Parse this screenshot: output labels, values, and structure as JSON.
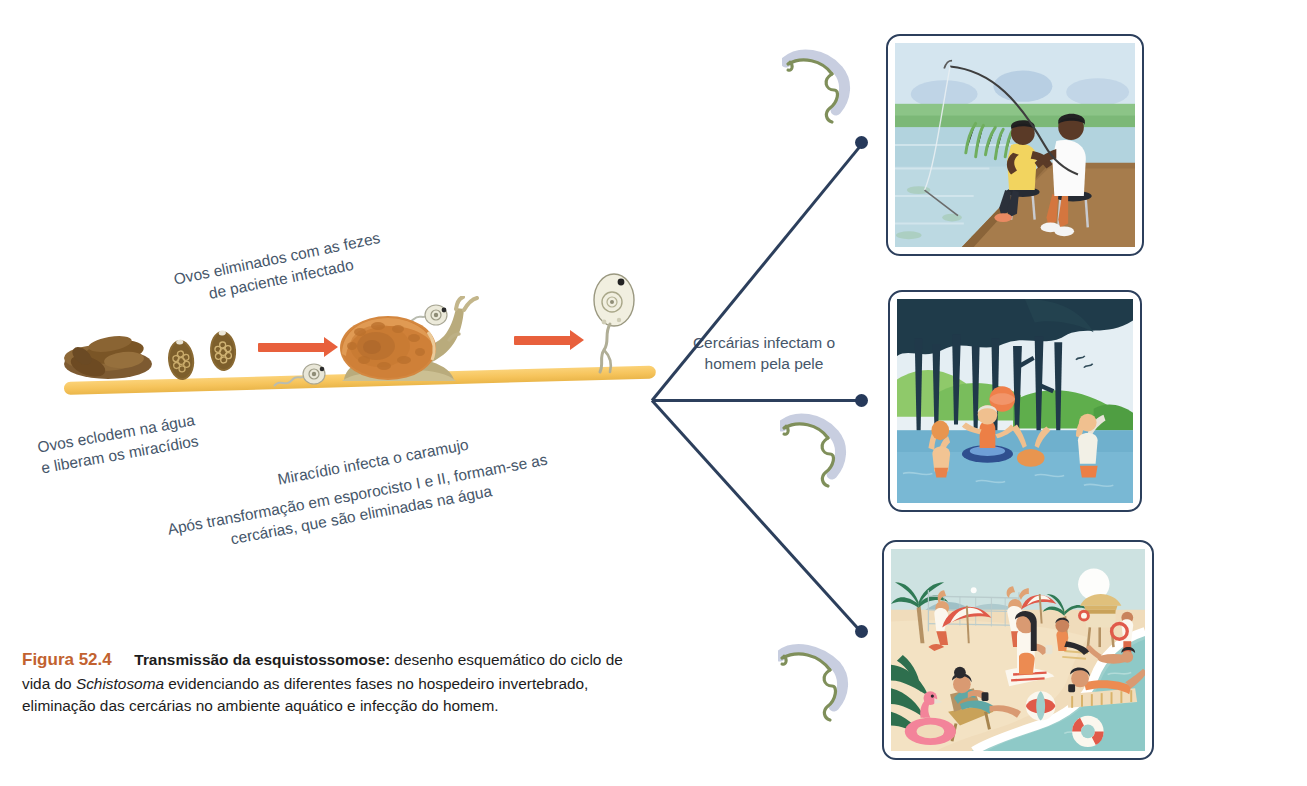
{
  "figure": {
    "number": "Figura 52.4",
    "title": "Transmissão da esquistossomose:",
    "caption_part1": " desenho esquemático do ciclo de vida do ",
    "caption_species": "Schistosoma",
    "caption_part2": " evidenciando as diferentes fases no hospedeiro invertebrado, eliminação das cercárias no ambiente aquático e infecção do homem."
  },
  "labels": {
    "eggs_feces_line1": "Ovos eliminados com as fezes",
    "eggs_feces_line2": "de paciente infectado",
    "hatch_line1": "Ovos eclodem na água",
    "hatch_line2": "e liberam os miracídios",
    "miracidium": "Miracídio infecta o caramujo",
    "cercariae_line1": "Após transformação em esporocisto I e II, formam-se as",
    "cercariae_line2": "cercárias, que são eliminadas na água",
    "skin_line1": "Cercárias infectam o",
    "skin_line2": "homem pela pele"
  },
  "stages": {
    "feces": "feces-icon",
    "egg_1": "schistosoma-egg-icon",
    "egg_2": "schistosoma-egg-icon",
    "miracidium_1": "miracidium-icon",
    "miracidium_2": "miracidium-icon",
    "snail": "snail-icon",
    "cercaria_large": "cercaria-icon",
    "arrow_1": "red-arrow-icon",
    "arrow_2": "red-arrow-icon",
    "water": "water-bar"
  },
  "panels": [
    {
      "name": "fishing-scene",
      "description": "Dois homens pescando sentados em um píer de madeira à beira de um lago"
    },
    {
      "name": "lake-swimming-scene",
      "description": "Pessoas brincando com bola em lago cercado por árvores escuras"
    },
    {
      "name": "beach-scene",
      "description": "Pessoas na praia tomando sol e nadando no mar"
    }
  ],
  "cercaria_icons": [
    "cercaria-icon",
    "cercaria-icon",
    "cercaria-icon"
  ],
  "colors": {
    "figure_number": "#c2622f",
    "arrow": "#e8603c",
    "water_bar": "#f6c45c",
    "connector": "#2c3f5c",
    "label_text": "#46566a"
  }
}
